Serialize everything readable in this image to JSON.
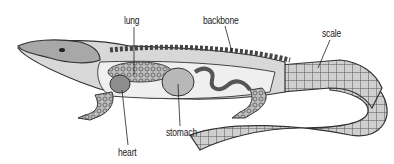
{
  "diagram": {
    "labels": {
      "lung": "lung",
      "backbone": "backbone",
      "scale": "scale",
      "heart": "heart",
      "stomach": "stomach"
    }
  }
}
